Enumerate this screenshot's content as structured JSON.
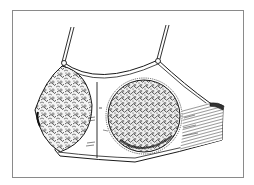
{
  "figure": {
    "alt": "Vintage engraving-style illustration of a bra with two patterned lace cups, thin shoulder straps, a center seam and a hatched side band",
    "frame_color": "#8a8a8a",
    "ink_color": "#1a1a1a",
    "paper_color": "#ffffff"
  }
}
